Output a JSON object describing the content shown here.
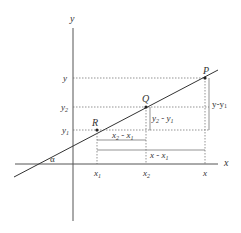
{
  "diagram": {
    "title": "",
    "axes": {
      "x_label": "x",
      "y_label": "y",
      "angle_label": "α"
    },
    "points": [
      {
        "name": "P",
        "coord_label_x": "x",
        "coord_label_y": "y"
      },
      {
        "name": "Q",
        "coord_label_x": "x2",
        "coord_label_y": "y2"
      },
      {
        "name": "R",
        "coord_label_x": "x1",
        "coord_label_y": "y1"
      }
    ],
    "y_ticks": {
      "y": "y",
      "y2": "y",
      "y2_sub": "2",
      "y1": "y",
      "y1_sub": "1"
    },
    "x_ticks": {
      "x1": "x",
      "x1_sub": "1",
      "x2": "x",
      "x2_sub": "2",
      "x": "x"
    },
    "differences": {
      "dx_q_r": {
        "a": "x",
        "a_sub": "2",
        "op": " - ",
        "b": "x",
        "b_sub": "1"
      },
      "dx_p_r": {
        "a": "x",
        "op": " - ",
        "b": "x",
        "b_sub": "1"
      },
      "dy_q_r": {
        "a": "y",
        "a_sub": "2",
        "op": " - ",
        "b": "y",
        "b_sub": "1"
      },
      "dy_p_r": {
        "text": "y-y",
        "sub": "1"
      }
    },
    "colors": {
      "line": "#333333",
      "axis": "#555555",
      "dashed": "#666666",
      "background": "#ffffff"
    }
  }
}
